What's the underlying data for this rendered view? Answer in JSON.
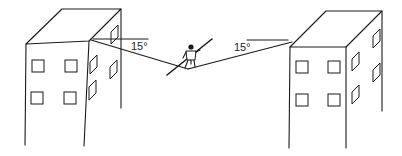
{
  "diagram": {
    "labels": {
      "left_angle": "15°",
      "right_angle": "15°"
    },
    "colors": {
      "line": "#1a1a1a",
      "background": "#ffffff"
    },
    "elements": {
      "left_building": "building-left",
      "right_building": "building-right",
      "rope": "tightrope",
      "walker": "tightrope-walker-with-pole"
    }
  }
}
